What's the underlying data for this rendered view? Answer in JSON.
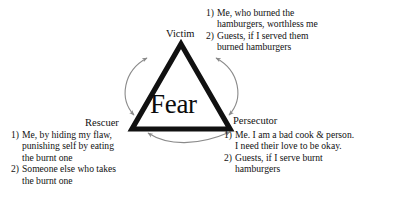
{
  "diagram": {
    "center_word": "Fear",
    "nodes": {
      "victim": "Victim",
      "rescuer": "Rescuer",
      "persecutor": "Persecutor"
    },
    "arrows": [
      {
        "name": "rescuer-to-victim",
        "style": "double-headed-curved-arc"
      },
      {
        "name": "victim-to-persecutor",
        "style": "double-headed-curved-arc"
      },
      {
        "name": "rescuer-to-persecutor",
        "style": "double-headed-curved-arc"
      }
    ],
    "colors": {
      "triangle": "#111111",
      "arrow": "#8a8a8a",
      "text": "#111111",
      "background": "#ffffff"
    }
  },
  "victim_block": {
    "items": [
      {
        "marker": "1)",
        "lines": [
          "Me, who burned the",
          "hamburgers, worthless me"
        ]
      },
      {
        "marker": "2)",
        "lines": [
          "Guests, if I served them",
          "burned hamburgers"
        ]
      }
    ]
  },
  "rescuer_block": {
    "items": [
      {
        "marker": "1)",
        "lines": [
          "Me, by hiding my flaw,",
          "punishing self by eating",
          "the burnt one"
        ]
      },
      {
        "marker": "2)",
        "lines": [
          "Someone else who takes",
          "the burnt one"
        ]
      }
    ]
  },
  "persecutor_block": {
    "items": [
      {
        "marker": "1)",
        "lines": [
          "Me. I am a bad cook & person.",
          "I need their love to be okay."
        ]
      },
      {
        "marker": "2)",
        "lines": [
          "Guests, if I serve burnt",
          "hamburgers"
        ]
      }
    ]
  }
}
